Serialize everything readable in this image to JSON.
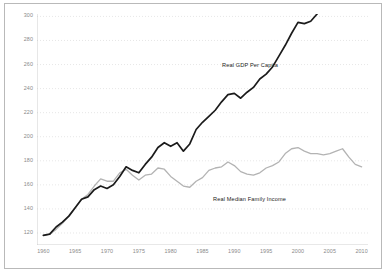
{
  "chart_data": {
    "type": "line",
    "title": "",
    "xlabel": "",
    "ylabel": "",
    "xlim": [
      1959,
      2011
    ],
    "ylim": [
      110,
      302
    ],
    "grid": true,
    "grid_style": "dotted-horizontal",
    "legend_position": "inline-annotation",
    "y_ticks": [
      120,
      140,
      160,
      180,
      200,
      220,
      240,
      260,
      280,
      300
    ],
    "x_ticks": [
      1960,
      1965,
      1970,
      1975,
      1980,
      1985,
      1990,
      1995,
      2000,
      2005,
      2010
    ],
    "series": [
      {
        "name": "Real GDP Per Capita",
        "color": "#1b1b1b",
        "x": [
          1960,
          1961,
          1962,
          1963,
          1964,
          1965,
          1966,
          1967,
          1968,
          1969,
          1970,
          1971,
          1972,
          1973,
          1974,
          1975,
          1976,
          1977,
          1978,
          1979,
          1980,
          1981,
          1982,
          1983,
          1984,
          1985,
          1986,
          1987,
          1988,
          1989,
          1990,
          1991,
          1992,
          1993,
          1994,
          1995,
          1996,
          1997,
          1998,
          1999,
          2000,
          2001,
          2002,
          2003,
          2004,
          2005,
          2006,
          2007,
          2008,
          2009,
          2010
        ],
        "values": [
          118,
          119,
          125,
          129,
          134,
          141,
          148,
          150,
          156,
          159,
          157,
          160,
          167,
          175,
          172,
          170,
          177,
          183,
          191,
          195,
          192,
          195,
          188,
          194,
          206,
          212,
          217,
          222,
          229,
          235,
          236,
          232,
          237,
          241,
          248,
          252,
          258,
          267,
          276,
          286,
          295,
          294,
          296,
          302,
          311,
          318,
          324,
          326,
          320,
          309,
          315
        ]
      },
      {
        "name": "Real Median Family Income",
        "color": "#b3b3b3",
        "x": [
          1960,
          1961,
          1962,
          1963,
          1964,
          1965,
          1966,
          1967,
          1968,
          1969,
          1970,
          1971,
          1972,
          1973,
          1974,
          1975,
          1976,
          1977,
          1978,
          1979,
          1980,
          1981,
          1982,
          1983,
          1984,
          1985,
          1986,
          1987,
          1988,
          1989,
          1990,
          1991,
          1992,
          1993,
          1994,
          1995,
          1996,
          1997,
          1998,
          1999,
          2000,
          2001,
          2002,
          2003,
          2004,
          2005,
          2006,
          2007,
          2008,
          2009,
          2010
        ],
        "values": [
          118,
          119,
          123,
          128,
          134,
          141,
          148,
          152,
          159,
          165,
          163,
          163,
          170,
          173,
          168,
          164,
          168,
          169,
          174,
          173,
          167,
          163,
          159,
          158,
          163,
          166,
          172,
          174,
          175,
          179,
          176,
          171,
          169,
          168,
          170,
          174,
          176,
          179,
          186,
          190,
          191,
          188,
          186,
          186,
          185,
          186,
          188,
          190,
          183,
          177,
          175
        ]
      }
    ],
    "annotations": [
      {
        "text": "Real GDP Per Capita",
        "x": 1994,
        "y": 258
      },
      {
        "text": "Real Median Family Income",
        "x": 1992,
        "y": 152
      }
    ]
  },
  "axes": {
    "y_labels": [
      "300",
      "280",
      "260",
      "240",
      "220",
      "200",
      "180",
      "160",
      "140",
      "120"
    ],
    "x_labels": [
      "1960",
      "1965",
      "1970",
      "1975",
      "1980",
      "1985",
      "1990",
      "1995",
      "2000",
      "2005",
      "2010"
    ]
  },
  "colors": {
    "gdp_line": "#1b1b1b",
    "income_line": "#b3b3b3",
    "grid": "#dcdcdc",
    "axis": "#c4c4c4",
    "frame_border": "#b9b9b9",
    "tick_text": "#8a8a8a",
    "annotation_text": "#1b1b1b",
    "background": "#ffffff"
  }
}
